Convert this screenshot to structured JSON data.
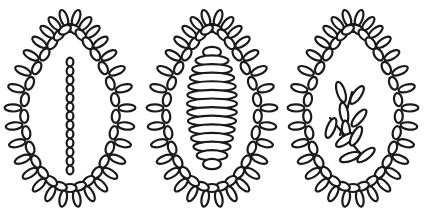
{
  "canvas": {
    "width": 424,
    "height": 223,
    "background_color": "#ffffff",
    "stroke_color": "#1a1a1a",
    "fill_color": "#ffffff"
  },
  "artwork": {
    "title": "Three beaded egg ornament motifs",
    "style": "line-art",
    "figure_count": 3
  },
  "figures": [
    {
      "name": "egg-beaded-chain",
      "index": 1,
      "center_x": 70,
      "center_y": 108,
      "egg": {
        "rx": 46,
        "ry": 80,
        "top_point": 0.62
      },
      "border": {
        "bead_count": 30,
        "bead_rx": 4.0,
        "bead_ry": 6.6,
        "petal_count": 30,
        "petal_rx": 3.6,
        "petal_ry": 8.4,
        "petal_offset": 11
      },
      "interior": {
        "type": "bead-chain",
        "bead_count": 13,
        "bead_rx": 3.4,
        "bead_ry": 4.4,
        "top_y": 62,
        "bottom_y": 170,
        "x": 70
      }
    },
    {
      "name": "egg-coiled-cocoon",
      "index": 2,
      "center_x": 212,
      "center_y": 108,
      "egg": {
        "rx": 46,
        "ry": 80,
        "top_point": 0.62
      },
      "border": {
        "bead_count": 30,
        "bead_rx": 4.0,
        "bead_ry": 6.6,
        "petal_count": 30,
        "petal_rx": 3.6,
        "petal_ry": 8.4,
        "petal_offset": 11
      },
      "interior": {
        "type": "coiled-barrel",
        "ring_count": 14,
        "top_y": 52,
        "bottom_y": 164,
        "max_rx": 25,
        "min_rx": 9,
        "ring_ry": 5.2,
        "x": 212
      }
    },
    {
      "name": "egg-leaf-sprigs",
      "index": 3,
      "center_x": 353,
      "center_y": 108,
      "egg": {
        "rx": 46,
        "ry": 80,
        "top_point": 0.62
      },
      "border": {
        "bead_count": 30,
        "bead_rx": 4.0,
        "bead_ry": 6.6,
        "petal_count": 30,
        "petal_rx": 3.6,
        "petal_ry": 8.4,
        "petal_offset": 11
      },
      "interior": {
        "type": "leaf-sprigs",
        "sprig_count": 2,
        "leaf_rx": 4.0,
        "leaf_ry": 10.5,
        "sprigs": [
          {
            "name": "upper-sprig",
            "stem_start": [
              340,
              135
            ],
            "stem_end": [
              352,
              92
            ],
            "leaves": [
              {
                "cx": 341,
                "cy": 92,
                "angle": -18
              },
              {
                "cx": 357,
                "cy": 95,
                "angle": 35
              },
              {
                "cx": 344,
                "cy": 113,
                "angle": -10
              },
              {
                "cx": 359,
                "cy": 118,
                "angle": 40
              },
              {
                "cx": 346,
                "cy": 131,
                "angle": -5
              }
            ]
          },
          {
            "name": "lower-sprig",
            "stem_start": [
              330,
              118
            ],
            "stem_end": [
              366,
              160
            ],
            "leaves": [
              {
                "cx": 331,
                "cy": 128,
                "angle": 22
              },
              {
                "cx": 345,
                "cy": 140,
                "angle": 55
              },
              {
                "cx": 356,
                "cy": 136,
                "angle": 28
              },
              {
                "cx": 350,
                "cy": 157,
                "angle": 70
              },
              {
                "cx": 366,
                "cy": 155,
                "angle": 52
              }
            ]
          }
        ]
      }
    }
  ]
}
